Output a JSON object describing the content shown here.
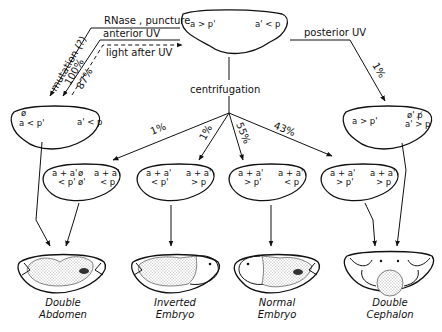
{
  "top_egg": {
    "left": "a > p'",
    "right": "a' < p"
  },
  "treatments_left": [
    {
      "label": "RNase , puncture"
    },
    {
      "label": "anterior UV"
    },
    {
      "label": "light after UV",
      "style": "dashed"
    }
  ],
  "left_branch_labels": [
    "mutation (?)",
    "100%",
    "87%"
  ],
  "posterior": {
    "label": "posterior UV",
    "percent": "1%"
  },
  "centrifugation": {
    "label": "centrifugation",
    "percents": [
      "1%",
      "1%",
      "55%",
      "43%"
    ]
  },
  "left_egg": {
    "top": "ø",
    "left": "a < p'",
    "right": "a' < p"
  },
  "right_egg": {
    "left": "a > p'",
    "right_top": "ø' p̸",
    "right_bottom": "a' > p"
  },
  "mid_eggs": [
    {
      "l1": "a + a'",
      "l2": "< p'",
      "c1": "ø",
      "c2": "ø'",
      "r1": "a + a'",
      "r2": "< p"
    },
    {
      "l1": "a + a'",
      "l2": "< p'",
      "c1": "",
      "c2": "",
      "r1": "a + a'",
      "r2": "> p"
    },
    {
      "l1": "a + a'",
      "l2": "> p'",
      "c1": "",
      "c2": "",
      "r1": "a + a'",
      "r2": "< p"
    },
    {
      "l1": "a + a'",
      "l2": "> p'",
      "c1": "",
      "c2": "",
      "r1": "a + a'",
      "r2": "> p"
    }
  ],
  "outcomes": [
    {
      "line1": "Double",
      "line2": "Abdomen"
    },
    {
      "line1": "Inverted",
      "line2": "Embryo"
    },
    {
      "line1": "Normal",
      "line2": "Embryo"
    },
    {
      "line1": "Double",
      "line2": "Cephalon"
    }
  ]
}
